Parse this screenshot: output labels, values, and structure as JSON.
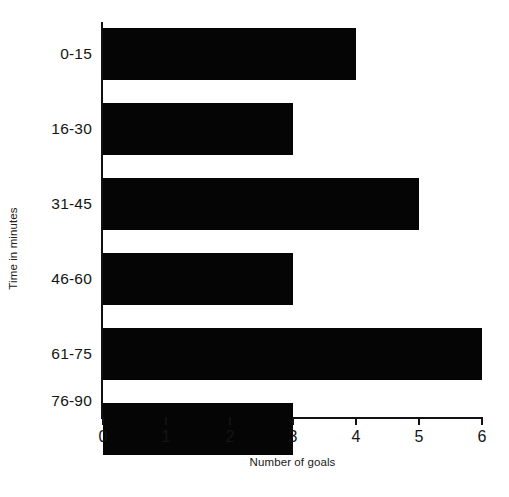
{
  "chart_data": {
    "type": "bar",
    "orientation": "horizontal",
    "title": "",
    "xlabel": "Number of goals",
    "ylabel": "Time in minutes",
    "categories": [
      "0-15",
      "16-30",
      "31-45",
      "46-60",
      "61-75",
      "76-90"
    ],
    "values": [
      4,
      3,
      5,
      3,
      6,
      3
    ],
    "xlim": [
      0,
      6
    ],
    "xticks": [
      "0",
      "1",
      "2",
      "3",
      "4",
      "5",
      "6"
    ],
    "xtick_values": [
      0,
      1,
      2,
      3,
      4,
      5,
      6
    ],
    "grid": false,
    "legend": false,
    "bar_color": "#050505",
    "axis_color": "#111111",
    "background_color": "#ffffff"
  }
}
